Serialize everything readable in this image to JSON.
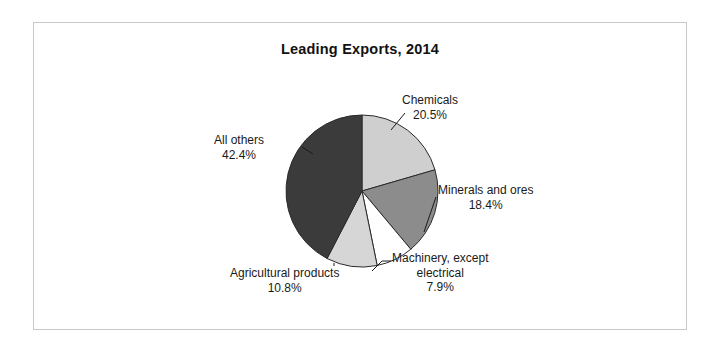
{
  "chart_data": {
    "type": "pie",
    "title": "Leading Exports, 2014",
    "xlabel": "",
    "ylabel": "",
    "legend_position": "none",
    "grid": false,
    "labels": [
      "Chemicals",
      "Minerals and ores",
      "Machinery, except electrical",
      "Agricultural products",
      "All others"
    ],
    "values": [
      20.5,
      18.4,
      7.9,
      10.8,
      42.4
    ],
    "value_suffix": "%",
    "start_angle_deg": 0,
    "direction": "clockwise",
    "colors": [
      "#cfcfcf",
      "#8c8c8c",
      "#ffffff",
      "#d6d6d6",
      "#3b3b3b"
    ],
    "slices": [
      {
        "name": "Chemicals",
        "value": 20.5,
        "value_label": "20.5%",
        "color": "#cfcfcf",
        "label_line1": "Chemicals",
        "label_line2": "",
        "label_line3": ""
      },
      {
        "name": "Minerals and ores",
        "value": 18.4,
        "value_label": "18.4%",
        "color": "#8c8c8c",
        "label_line1": "Minerals and ores",
        "label_line2": "",
        "label_line3": ""
      },
      {
        "name": "Machinery, except electrical",
        "value": 7.9,
        "value_label": "7.9%",
        "color": "#ffffff",
        "label_line1": "Machinery, except",
        "label_line2": "electrical",
        "label_line3": ""
      },
      {
        "name": "Agricultural products",
        "value": 10.8,
        "value_label": "10.8%",
        "color": "#d6d6d6",
        "label_line1": "Agricultural products",
        "label_line2": "",
        "label_line3": ""
      },
      {
        "name": "All others",
        "value": 42.4,
        "value_label": "42.4%",
        "color": "#3b3b3b",
        "label_line1": "All others",
        "label_line2": "",
        "label_line3": ""
      }
    ]
  },
  "frame": {
    "border_color": "#c9c9c9",
    "background": "#ffffff"
  }
}
